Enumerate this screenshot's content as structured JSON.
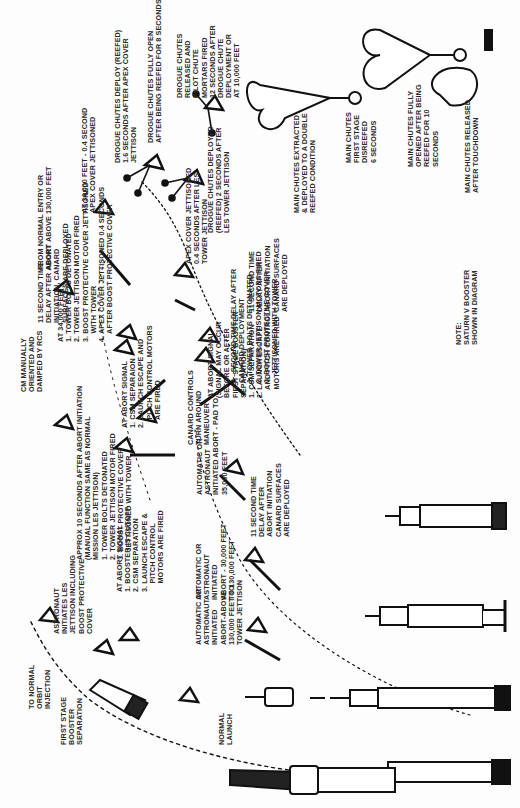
{
  "diagram": {
    "labels": [
      {
        "id": "normal-launch",
        "text": "NORMAL\nLAUNCH",
        "x": 218,
        "y": 745
      },
      {
        "id": "first-stage-sep",
        "text": "FIRST STAGE\nBOOSTER\nSEPARATION",
        "x": 60,
        "y": 745
      },
      {
        "id": "abort-above-130k",
        "text": "AUTOMATIC OR\nASTRONAUT\nINITIATED\nABORT-ABOVE\n130,000 FEET TO\nTOWER JETTISON",
        "x": 195,
        "y": 645
      },
      {
        "id": "abort-30k-130k",
        "text": "AUTOMATIC OR\nASTRONAUT\nINITIATED\nABORT - 30,000 FEET\nTO 130,000 FEET",
        "x": 195,
        "y": 600
      },
      {
        "id": "abort-pad-to-35k",
        "text": "AUTOMATIC OR\nASTRONAUT\nINITIATED ABORT - PAD TO\n35,000 FEET",
        "x": 196,
        "y": 495
      },
      {
        "id": "at-abort-signal-booster",
        "text": "AT ABORT SIGNAL\n1. BOOSTER IS CUTOFF\n2. CSM SEPARATION\n3. LAUNCH ESCAPE &\n    PITCH CONTROL\n    MOTORS ARE FIRED",
        "x": 116,
        "y": 592
      },
      {
        "id": "at-abort-signal-csm",
        "text": "AT ABORT SIGNAL\n1. CSM SEPARAION\n2. LAUNCH ESCAPE AND\n    PITCH CONTROL MOTORS\n    ARE FIRED",
        "x": 121,
        "y": 428
      },
      {
        "id": "at-abort-signal-first-stage",
        "text": "AT ABORT SIGNAL\n(SIGNAL MAY OCCUR\nBEFORE OR AFTER\nFIRST STAGE BOOSTER\nSEPARATION)\n1. CSM SEPARATION\n2. LAUNCH ESCAPE\n    AND PITCH CONTROL\n    MOTORS ARE FIRED",
        "x": 207,
        "y": 398
      },
      {
        "id": "11-sec-delay-canard-1",
        "text": "11 SECOND TIME\nDELAY AFTER ABORT\nINITIATION, CANARD\nSURFACES ARE DEPLOYED",
        "x": 37,
        "y": 323
      },
      {
        "id": "11-sec-delay-canard-2",
        "text": "11 SECOND TIME\nDELAY AFTER\nABORT INITIATION\nCANARD SURFACES\nARE DEPLOYED",
        "x": 248,
        "y": 312
      },
      {
        "id": "11-sec-delay-canard-3",
        "text": "11 SECOND TIME\nDELAY AFTER\nABORT INITIATION\nCANARD SURFACES\nARE DEPLOYED",
        "x": 250,
        "y": 537
      },
      {
        "id": "canard-controls",
        "text": "CANARD CONTROLS\nTURN AROUND\nMANEUVER",
        "x": 187,
        "y": 445
      },
      {
        "id": "to-normal-orbit",
        "text": "TO NORMAL\nORBIT\nINJECTION",
        "x": 28,
        "y": 709
      },
      {
        "id": "astronaut-initiates-les",
        "text": "ASTRONAUT\nINITIATES LES\nJETTISON INCLUDING\nBOOST PROTECTIVE\nCOVER",
        "x": 53,
        "y": 634
      },
      {
        "id": "approx-10-seconds",
        "text": "APPROX 10 SECONDS AFTER ABORT INITIATION\n(MANUAL FUNCTION SAME AS NORMAL\nMISSION LES JETTISON)\n1. TOWER BOLTS DETONATED\n2. TOWER JETTISON MOTOR FIRED\n3. BOOST PROTECTIVE COVER\n    JETTISONED WITH TOWER",
        "x": 76,
        "y": 560
      },
      {
        "id": "cm-manually-oriented",
        "text": "CM MANUALLY\nORIENTED AND\nDAMPED BY RCS",
        "x": 20,
        "y": 392
      },
      {
        "id": "at-34000-feet",
        "text": "AT 34,000 FEET:\n1. TOWER BOLTS DETONATED\n2. TOWER JETTISON MOTOR FIRED\n3. BOOST PROTECTIVE COVER JETTISONED\n    WITH TOWER\n4. APEX COVER JETTISONED 0.4 SECONDS\n    AFTER BOOST PROTECTIVE COVER",
        "x": 57,
        "y": 342
      },
      {
        "id": "from-normal-entry",
        "text": "FROM NORMAL ENTRY OR\nABORT ABOVE 130,000 FEET",
        "x": 37,
        "y": 270
      },
      {
        "id": "apex-cover-0-4",
        "text": "APEX COVER JETTISONED\n0.4 SECONDS AFTER LES\nTOWER JETTISON",
        "x": 185,
        "y": 264
      },
      {
        "id": "3-second-delay",
        "text": "3 - SECOND TIME DELAY AFTER\nCANARD DEPLOYMENT\n1. TOWER BOLTS DETONATED\n2. TOWER JETTISON MOTORS FIRED\n3. BOOST PROTECTIVE COVER\n    JETTISONED WITH TOWER",
        "x": 230,
        "y": 383
      },
      {
        "id": "at-34000-apex",
        "text": "AT 34,000 FEET - 0.4 SECOND\nAPEX COVER JETTISONED",
        "x": 81,
        "y": 213
      },
      {
        "id": "drogue-deploy-reefed",
        "text": "DROGUE CHUTES DEPLOY (REEFED)\n1.6 SECONDS AFTER APEX COVER\nJETTISON",
        "x": 114,
        "y": 163
      },
      {
        "id": "drogue-deployed-2-sec",
        "text": "DROGUE CHUTES DEPLOYED\n(REEFED) 2 SECONDS AFTER\nLES TOWER JETTISON",
        "x": 207,
        "y": 233
      },
      {
        "id": "drogue-fully-open",
        "text": "DROGUE CHUTES FULLY OPEN\nAFTER BEING REEFED FOR 8 SECONDS",
        "x": 147,
        "y": 143
      },
      {
        "id": "drogue-released",
        "text": "DROGUE CHUTES\nRELEASED AND\nPILOT CHUTE\nMORTARS FIRED\n12 SECONDS AFTER\nDROGUE CHUTE\nDEPLOYMENT OR\nAT 10,000 FEET",
        "x": 176,
        "y": 98
      },
      {
        "id": "main-chutes-extracted",
        "text": "MAIN CHUTES EXTRACTED\n& DEPLOYED TO A DOUBLE\nREEFED CONDITION",
        "x": 293,
        "y": 213
      },
      {
        "id": "main-chutes-first-stage",
        "text": "MAIN CHUTES\nFIRST STAGE\nDISREEFED\n6 SECONDS",
        "x": 345,
        "y": 163
      },
      {
        "id": "main-chutes-fully-opened",
        "text": "MAIN CHUTES FULLY\nOPENED AFTER BEING\nREEFED FOR 10\nSECONDS",
        "x": 407,
        "y": 167
      },
      {
        "id": "main-chutes-released",
        "text": "MAIN CHUTES RELEASED\nAFTER TOUCHDOWN",
        "x": 464,
        "y": 193
      },
      {
        "id": "note",
        "text": "NOTE:\nSATURN V BOOSTER\nSHOWN IN DIAGRAM",
        "x": 455,
        "y": 345
      }
    ]
  }
}
